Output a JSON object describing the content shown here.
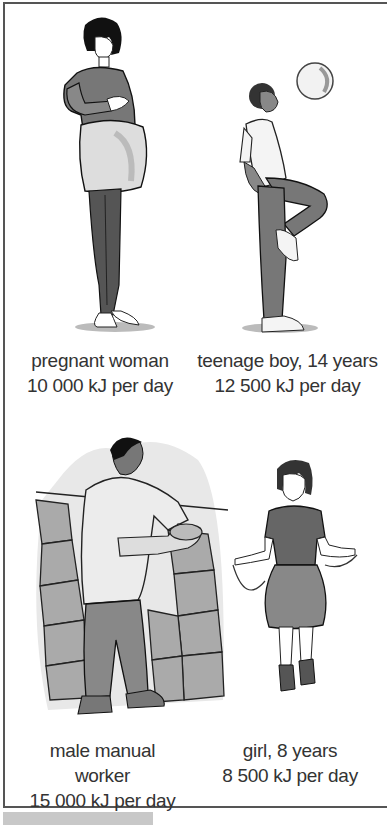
{
  "figure": {
    "panels": [
      {
        "id": "pregnant-woman",
        "label": "pregnant woman",
        "energy": "10 000 kJ per day"
      },
      {
        "id": "teenage-boy",
        "label": "teenage boy, 14 years",
        "energy": "12 500 kJ per day"
      },
      {
        "id": "male-manual-worker",
        "label_line1": "male manual",
        "label_line2": "worker",
        "energy": "15 000 kJ per day"
      },
      {
        "id": "girl",
        "label": "girl, 8 years",
        "energy": "8 500 kJ per day"
      }
    ]
  }
}
